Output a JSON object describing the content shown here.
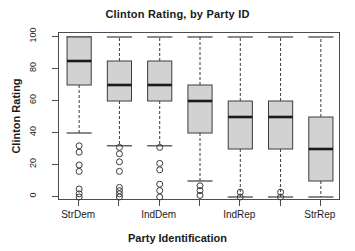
{
  "chart_data": {
    "type": "box",
    "title": "Clinton Rating, by Party ID",
    "xlabel": "Party Identification",
    "ylabel": "Clinton Rating",
    "ylim": [
      0,
      100
    ],
    "yticks": [
      0,
      20,
      40,
      60,
      80,
      100
    ],
    "grid": false,
    "legend": "none",
    "box_fill": "#d2d2d2",
    "box_stroke": "#3c3c3c",
    "median_color": "#1a1a1a",
    "categories": [
      "StrDem",
      "",
      "IndDem",
      "",
      "IndRep",
      "",
      "StrRep"
    ],
    "tick_labels_shown": [
      "StrDem",
      "IndDem",
      "IndRep",
      "StrRep"
    ],
    "boxes": [
      {
        "category": "StrDem",
        "position": 1,
        "whisker_low": 40,
        "q1": 70,
        "median": 85,
        "q3": 100,
        "whisker_high": 100,
        "outliers": [
          32,
          28,
          20,
          16,
          5,
          2,
          0
        ]
      },
      {
        "category": "2",
        "position": 2,
        "whisker_low": 32,
        "q1": 60,
        "median": 70,
        "q3": 85,
        "whisker_high": 100,
        "outliers": [
          31,
          27,
          22,
          16,
          6,
          4,
          2,
          0
        ]
      },
      {
        "category": "IndDem",
        "position": 3,
        "whisker_low": 32,
        "q1": 60,
        "median": 70,
        "q3": 85,
        "whisker_high": 100,
        "outliers": [
          31,
          21,
          17,
          8,
          4,
          0
        ]
      },
      {
        "category": "4",
        "position": 4,
        "whisker_low": 10,
        "q1": 40,
        "median": 60,
        "q3": 70,
        "whisker_high": 100,
        "outliers": [
          7,
          4,
          1
        ]
      },
      {
        "category": "IndRep",
        "position": 5,
        "whisker_low": 0,
        "q1": 30,
        "median": 50,
        "q3": 60,
        "whisker_high": 100,
        "outliers": [
          3,
          0
        ]
      },
      {
        "category": "6",
        "position": 6,
        "whisker_low": 0,
        "q1": 30,
        "median": 50,
        "q3": 60,
        "whisker_high": 100,
        "outliers": [
          3,
          0
        ]
      },
      {
        "category": "StrRep",
        "position": 7,
        "whisker_low": 0,
        "q1": 10,
        "median": 30,
        "q3": 50,
        "whisker_high": 100,
        "outliers": []
      }
    ]
  }
}
